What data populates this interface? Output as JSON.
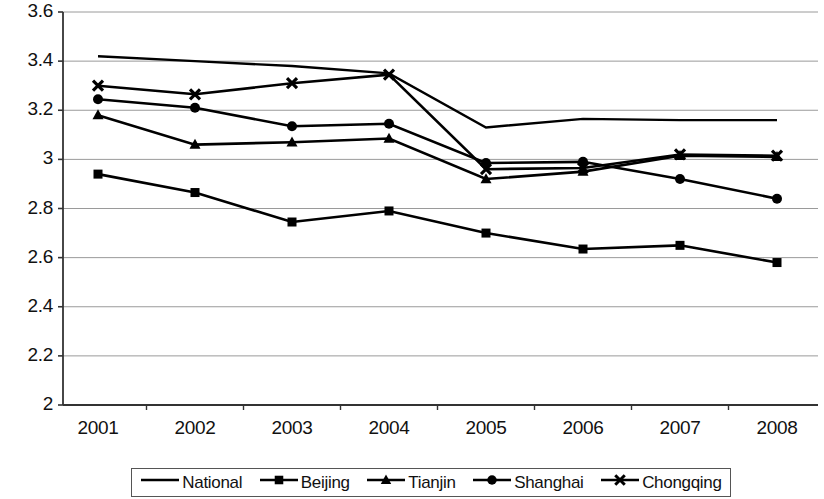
{
  "chart_data": {
    "type": "line",
    "title": "",
    "xlabel": "",
    "ylabel": "",
    "categories": [
      "2001",
      "2002",
      "2003",
      "2004",
      "2005",
      "2006",
      "2007",
      "2008"
    ],
    "x_tick_labels": [
      "2001",
      "2002",
      "2003",
      "2004",
      "2005",
      "2006",
      "2007",
      "2008"
    ],
    "y_tick_labels": [
      "3.6",
      "3.4",
      "3.2",
      "3",
      "2.8",
      "2.6",
      "2.4",
      "2.2",
      "2"
    ],
    "y_tick_values": [
      3.6,
      3.4,
      3.2,
      3.0,
      2.8,
      2.6,
      2.4,
      2.2,
      2.0
    ],
    "ylim": [
      2.0,
      3.6
    ],
    "grid": true,
    "grid_axis": "y",
    "legend_position": "bottom",
    "line_color": "#000000",
    "grid_color": "#9a9a9a",
    "axis_color": "#333333",
    "series": [
      {
        "name": "National",
        "marker": "none",
        "values": [
          3.42,
          3.4,
          3.38,
          3.35,
          3.13,
          3.165,
          3.16,
          3.16
        ]
      },
      {
        "name": "Beijing",
        "marker": "square",
        "values": [
          2.94,
          2.865,
          2.745,
          2.79,
          2.7,
          2.635,
          2.65,
          2.58
        ]
      },
      {
        "name": "Tianjin",
        "marker": "triangle",
        "values": [
          3.18,
          3.06,
          3.07,
          3.085,
          2.92,
          2.95,
          3.015,
          3.01
        ]
      },
      {
        "name": "Shanghai",
        "marker": "circle",
        "values": [
          3.245,
          3.21,
          3.135,
          3.145,
          2.985,
          2.99,
          2.92,
          2.84
        ]
      },
      {
        "name": "Chongqing",
        "marker": "x",
        "values": [
          3.3,
          3.265,
          3.31,
          3.345,
          2.96,
          2.965,
          3.02,
          3.015
        ]
      }
    ]
  },
  "legend": {
    "items": [
      {
        "label": "National",
        "marker": "none"
      },
      {
        "label": "Beijing",
        "marker": "square"
      },
      {
        "label": "Tianjin",
        "marker": "triangle"
      },
      {
        "label": "Shanghai",
        "marker": "circle"
      },
      {
        "label": "Chongqing",
        "marker": "x"
      }
    ]
  }
}
